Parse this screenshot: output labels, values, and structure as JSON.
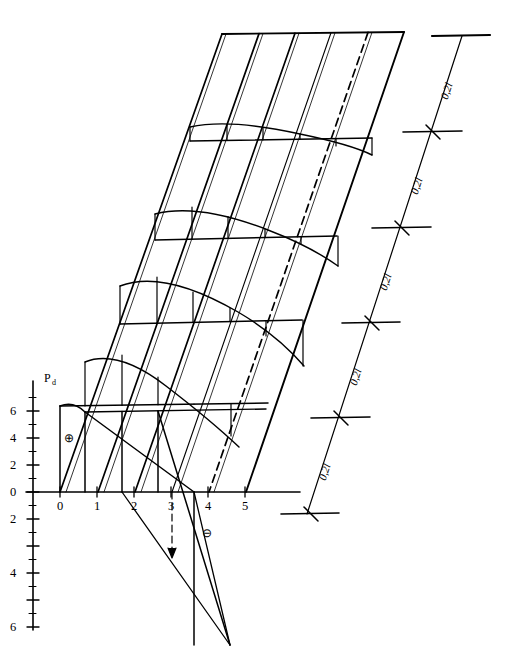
{
  "figure": {
    "kind": "influence-surface-diagram",
    "ordinate_axis_label": "P",
    "ordinate_axis_subscript": "d",
    "sign_positive": "⊕",
    "sign_negative": "⊖",
    "line_color": "#000000",
    "background_color": "#ffffff"
  },
  "x_axis": {
    "ticks": [
      "0",
      "1",
      "2",
      "3",
      "4",
      "5"
    ]
  },
  "y_axis": {
    "ticks_above": [
      "6",
      "4",
      "2",
      "0"
    ],
    "ticks_below": [
      "2",
      "4",
      "6"
    ]
  },
  "dimension_line": {
    "segment_labels": [
      "0,2l",
      "0,2l",
      "0,2l",
      "0,2l",
      "0,2l"
    ]
  }
}
